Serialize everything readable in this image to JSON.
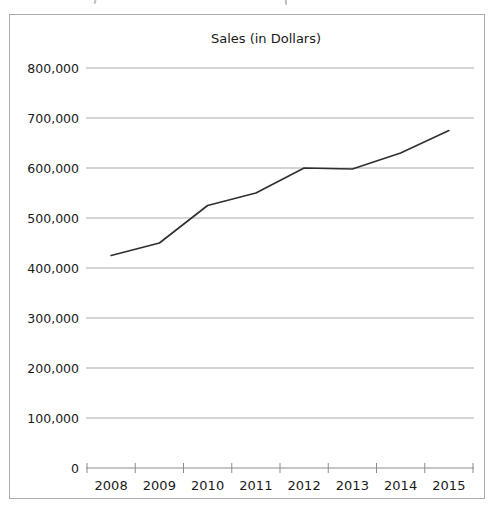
{
  "chart_data": {
    "type": "line",
    "title": "Sales (in Dollars)",
    "categories": [
      "2008",
      "2009",
      "2010",
      "2011",
      "2012",
      "2013",
      "2014",
      "2015"
    ],
    "values": [
      425000,
      450000,
      525000,
      550000,
      600000,
      598000,
      630000,
      675000
    ],
    "xlabel": "",
    "ylabel": "",
    "ylim": [
      0,
      800000
    ],
    "yticks": [
      800000,
      700000,
      600000,
      500000,
      400000,
      300000,
      200000,
      100000,
      0
    ],
    "ytick_labels": [
      "800,000",
      "700,000",
      "600,000",
      "500,000",
      "400,000",
      "300,000",
      "200,000",
      "100,000",
      "0"
    ],
    "grid": true,
    "legend": "none",
    "colors": {
      "line": "#2f2f2f",
      "grid": "#ababab",
      "axis": "#8c8c8c",
      "panel_border": "#ababab",
      "text": "#1a1a1a",
      "background": "#ffffff"
    }
  }
}
